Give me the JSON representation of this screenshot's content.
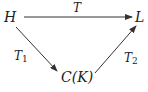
{
  "diagram": {
    "type": "commutative-diagram",
    "nodes": {
      "H": {
        "label": "H"
      },
      "L": {
        "label": "L"
      },
      "CK": {
        "label": "C(K)"
      }
    },
    "edges": {
      "T": {
        "from": "H",
        "to": "L",
        "label": "T"
      },
      "T1": {
        "from": "H",
        "to": "C(K)",
        "label": "T",
        "sub": "1"
      },
      "T2": {
        "from": "C(K)",
        "to": "L",
        "label": "T",
        "sub": "2"
      }
    }
  }
}
